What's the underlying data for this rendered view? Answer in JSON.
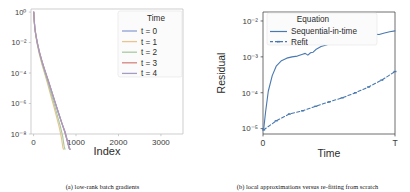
{
  "figure": {
    "panels": [
      {
        "caption": "(a) low-rank batch gradients",
        "legend": {
          "title": "Time",
          "entries": [
            {
              "label": "t = 0",
              "color": "#8c9fd4"
            },
            {
              "label": "t = 1",
              "color": "#e8c48f"
            },
            {
              "label": "t = 2",
              "color": "#a8c9a0"
            },
            {
              "label": "t = 3",
              "color": "#d4837c"
            },
            {
              "label": "t = 4",
              "color": "#a59cc4"
            }
          ]
        }
      },
      {
        "caption": "(b) local approximations versus re-fitting from scratch",
        "legend": {
          "title": "Equation",
          "entries": [
            {
              "label": "Sequential-in-time",
              "color": "#4878b0",
              "style": "solid"
            },
            {
              "label": "Refit",
              "color": "#4878b0",
              "style": "dashed"
            }
          ]
        }
      }
    ]
  },
  "chart_data": [
    {
      "type": "line",
      "title": "",
      "xlabel": "Index",
      "ylabel": "",
      "xlim": [
        -60,
        3520
      ],
      "ylim_log": [
        -8,
        0.2
      ],
      "yscale": "log",
      "xticks": [
        0,
        1000,
        2000,
        3000
      ],
      "xticklabels": [
        "0",
        "1000",
        "2000",
        "3000"
      ],
      "yticks": [
        1,
        0.01,
        0.0001,
        1e-06,
        1e-08
      ],
      "yticklabels": [
        "10⁰",
        "10⁻²",
        "10⁻⁴",
        "10⁻⁶",
        "10⁻⁸"
      ],
      "grid": false,
      "legend_title": "Time",
      "legend_position": "upper right",
      "series": [
        {
          "name": "t = 0",
          "color": "#8c9fd4",
          "x": [
            5,
            15,
            30,
            55,
            90,
            140,
            200,
            270,
            350,
            430,
            510,
            590,
            670,
            740,
            800,
            845,
            860
          ],
          "y": [
            1.0,
            0.3,
            0.09,
            0.03,
            0.009,
            0.0022,
            0.00055,
            0.00013,
            2.8e-05,
            5.5e-06,
            1.1e-06,
            2.2e-07,
            4.8e-08,
            1.3e-08,
            3e-09,
            1.05e-09,
            1e-09
          ]
        },
        {
          "name": "t = 1",
          "color": "#e8c48f",
          "x": [
            5,
            15,
            30,
            55,
            90,
            140,
            200,
            270,
            340,
            410,
            480,
            550,
            610,
            660,
            690,
            705
          ],
          "y": [
            1.0,
            0.28,
            0.08,
            0.025,
            0.007,
            0.0016,
            0.00036,
            8e-05,
            1.6e-05,
            3.1e-06,
            6e-07,
            1.1e-07,
            2.4e-08,
            5e-09,
            1.3e-09,
            1e-09
          ]
        },
        {
          "name": "t = 2",
          "color": "#a8c9a0",
          "x": [
            5,
            15,
            30,
            55,
            90,
            140,
            200,
            270,
            345,
            420,
            495,
            565,
            630,
            685,
            720,
            740
          ],
          "y": [
            1.0,
            0.29,
            0.085,
            0.027,
            0.0078,
            0.0018,
            0.00042,
            9.5e-05,
            2e-05,
            3.9e-06,
            7.8e-07,
            1.5e-07,
            3.3e-08,
            7.2e-09,
            1.6e-09,
            1e-09
          ]
        },
        {
          "name": "t = 3",
          "color": "#d4837c",
          "x": [
            5,
            15,
            30,
            55,
            90,
            140,
            200,
            270,
            350,
            430,
            510,
            590,
            665,
            735,
            795,
            840,
            858
          ],
          "y": [
            1.0,
            0.31,
            0.095,
            0.031,
            0.0094,
            0.0023,
            0.00058,
            0.00014,
            3e-05,
            6e-06,
            1.2e-06,
            2.4e-07,
            5.2e-08,
            1.4e-08,
            3.3e-09,
            1.1e-09,
            1e-09
          ]
        },
        {
          "name": "t = 4",
          "color": "#a59cc4",
          "x": [
            5,
            15,
            30,
            55,
            90,
            140,
            200,
            270,
            350,
            430,
            510,
            590,
            670,
            745,
            805,
            850,
            865
          ],
          "y": [
            1.0,
            0.3,
            0.092,
            0.03,
            0.0091,
            0.0022,
            0.00056,
            0.000135,
            2.9e-05,
            5.7e-06,
            1.15e-06,
            2.3e-07,
            5e-08,
            1.35e-08,
            3.1e-09,
            1.1e-09,
            1e-09
          ]
        }
      ]
    },
    {
      "type": "line",
      "title": "",
      "xlabel": "Time",
      "ylabel": "Residual",
      "xlim": [
        0,
        1
      ],
      "ylim_log": [
        -5.15,
        -1.75
      ],
      "yscale": "log",
      "xticks": [
        0,
        1
      ],
      "xticklabels": [
        "0",
        "T"
      ],
      "yticks": [
        0.01,
        0.001,
        0.0001,
        1e-05
      ],
      "yticklabels": [
        "10⁻²",
        "10⁻³",
        "10⁻⁴",
        "10⁻⁵"
      ],
      "grid": false,
      "legend_title": "Equation",
      "legend_position": "upper left",
      "series": [
        {
          "name": "Sequential-in-time",
          "color": "#4878b0",
          "style": "solid",
          "x": [
            0.005,
            0.02,
            0.04,
            0.07,
            0.1,
            0.14,
            0.18,
            0.22,
            0.26,
            0.3,
            0.32,
            0.34,
            0.36,
            0.38,
            0.4,
            0.44,
            0.48,
            0.5,
            0.52,
            0.56,
            0.6,
            0.62,
            0.64,
            0.68,
            0.72,
            0.76,
            0.8,
            0.84,
            0.88,
            0.92,
            0.96,
            1.0
          ],
          "y": [
            9.5e-06,
            3e-05,
            0.00011,
            0.0003,
            0.00055,
            0.00078,
            0.00092,
            0.001,
            0.00105,
            0.00118,
            0.00125,
            0.00112,
            0.0013,
            0.00135,
            0.0016,
            0.00195,
            0.00215,
            0.0023,
            0.00225,
            0.00245,
            0.00258,
            0.0025,
            0.00262,
            0.0027,
            0.0029,
            0.0034,
            0.004,
            0.0043,
            0.0042,
            0.0046,
            0.005,
            0.0053
          ]
        },
        {
          "name": "Refit",
          "color": "#4878b0",
          "style": "dashed",
          "x": [
            0.005,
            0.1,
            0.2,
            0.3,
            0.4,
            0.5,
            0.6,
            0.7,
            0.8,
            0.9,
            1.0
          ],
          "y": [
            9.2e-06,
            1.65e-05,
            2.55e-05,
            3.15e-05,
            4.2e-05,
            5.55e-05,
            7.2e-05,
            0.0001,
            0.000145,
            0.000225,
            0.00039
          ]
        }
      ]
    }
  ]
}
